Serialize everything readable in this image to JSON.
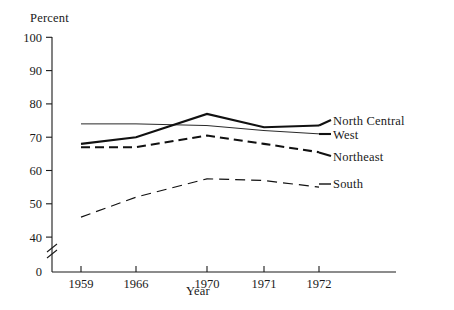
{
  "chart_data": {
    "type": "line",
    "title": "",
    "xlabel": "Year",
    "ylabel": "Percent",
    "categories": [
      "1959",
      "1966",
      "1970",
      "1971",
      "1972"
    ],
    "x_tick_labels": [
      "1959",
      "1966",
      "1970",
      "1971",
      "1972"
    ],
    "y_tick_labels": [
      "0",
      "40",
      "50",
      "60",
      "70",
      "80",
      "90",
      "100"
    ],
    "ylim": [
      0,
      100
    ],
    "y_axis_break": true,
    "y_axis_break_note": "axis broken between 0 and 40",
    "grid": false,
    "legend_position": "right-inline",
    "series": [
      {
        "name": "North Central",
        "style": "solid-thick",
        "color": "#111111",
        "values": [
          68,
          70,
          77,
          73,
          73.5
        ]
      },
      {
        "name": "West",
        "style": "solid-thin",
        "color": "#111111",
        "values": [
          74,
          74,
          73.5,
          72,
          71
        ]
      },
      {
        "name": "Northeast",
        "style": "dashed-thick",
        "color": "#111111",
        "values": [
          67,
          67,
          70.5,
          68,
          65.5
        ]
      },
      {
        "name": "South",
        "style": "dashed-thin",
        "color": "#111111",
        "values": [
          46,
          52,
          57.5,
          57,
          55
        ]
      }
    ]
  },
  "axis": {
    "y_title": "Percent",
    "x_title": "Year",
    "y_ticks": [
      "100",
      "90",
      "80",
      "70",
      "60",
      "50",
      "40",
      "0"
    ],
    "x_ticks": [
      "1959",
      "1966",
      "1970",
      "1971",
      "1972"
    ]
  },
  "legend": {
    "items": [
      {
        "label": "North Central"
      },
      {
        "label": "West"
      },
      {
        "label": "Northeast"
      },
      {
        "label": "South"
      }
    ]
  }
}
